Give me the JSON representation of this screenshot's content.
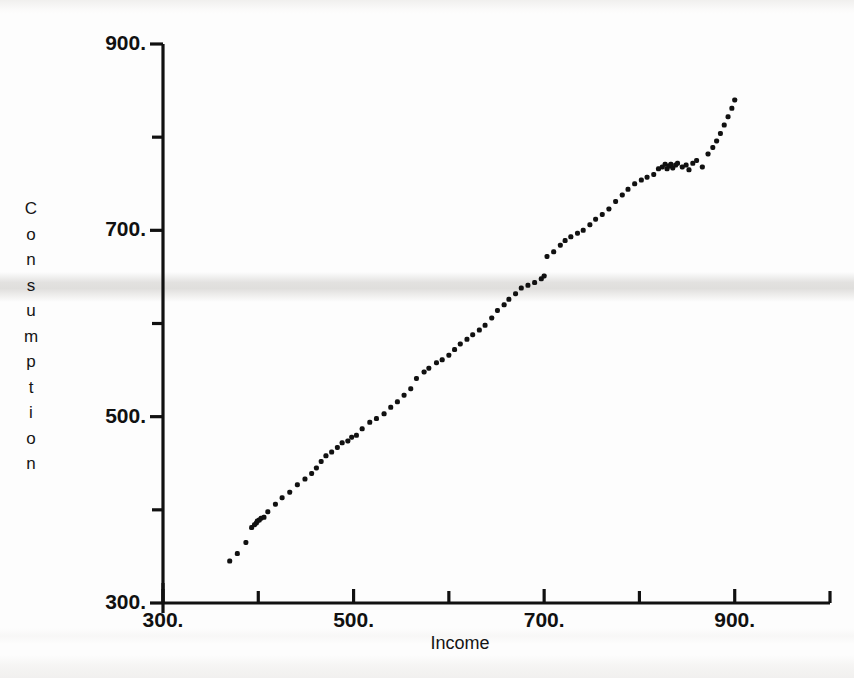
{
  "figure": {
    "background_color": "#fdfdfd",
    "ink_color": "#111111",
    "artifact": "horizontal-scan-band"
  },
  "axis_titles": {
    "x": "Income",
    "y": "Consumption",
    "y_stacked_letters": [
      "C",
      "o",
      "n",
      "s",
      "u",
      "m",
      "p",
      "t",
      "i",
      "o",
      "n"
    ]
  },
  "x_tick_labels": [
    "300.",
    "500.",
    "700.",
    "900."
  ],
  "y_tick_labels": [
    "300.",
    "500.",
    "700.",
    "900."
  ],
  "chart_data": {
    "type": "scatter",
    "title": "",
    "xlabel": "Income",
    "ylabel": "Consumption",
    "xlim": [
      300,
      1000
    ],
    "ylim": [
      300,
      900
    ],
    "xticks": [
      300,
      500,
      700,
      900
    ],
    "yticks": [
      300,
      500,
      700,
      900
    ],
    "xticks_minor": [
      400,
      600,
      800,
      1000
    ],
    "yticks_minor": [
      400,
      600,
      800
    ],
    "xtick_format": "trailing-period",
    "ytick_format": "trailing-period",
    "grid": false,
    "legend": null,
    "marker": "dot",
    "marker_size_px": 5,
    "marker_color": "#111111",
    "points": [
      [
        370,
        345
      ],
      [
        378,
        353
      ],
      [
        387,
        365
      ],
      [
        393,
        381
      ],
      [
        396,
        384
      ],
      [
        398,
        386
      ],
      [
        399,
        388
      ],
      [
        401,
        389
      ],
      [
        403,
        391
      ],
      [
        406,
        392
      ],
      [
        410,
        398
      ],
      [
        418,
        406
      ],
      [
        425,
        413
      ],
      [
        433,
        419
      ],
      [
        441,
        427
      ],
      [
        449,
        433
      ],
      [
        456,
        439
      ],
      [
        461,
        445
      ],
      [
        466,
        452
      ],
      [
        471,
        458
      ],
      [
        477,
        462
      ],
      [
        483,
        467
      ],
      [
        488,
        472
      ],
      [
        494,
        474
      ],
      [
        498,
        478
      ],
      [
        503,
        480
      ],
      [
        509,
        487
      ],
      [
        517,
        494
      ],
      [
        524,
        498
      ],
      [
        532,
        503
      ],
      [
        539,
        510
      ],
      [
        546,
        516
      ],
      [
        553,
        523
      ],
      [
        560,
        530
      ],
      [
        566,
        541
      ],
      [
        574,
        548
      ],
      [
        579,
        552
      ],
      [
        587,
        558
      ],
      [
        593,
        561
      ],
      [
        600,
        566
      ],
      [
        606,
        572
      ],
      [
        612,
        578
      ],
      [
        619,
        583
      ],
      [
        625,
        588
      ],
      [
        632,
        593
      ],
      [
        638,
        598
      ],
      [
        645,
        606
      ],
      [
        651,
        614
      ],
      [
        658,
        620
      ],
      [
        663,
        626
      ],
      [
        670,
        632
      ],
      [
        676,
        638
      ],
      [
        683,
        641
      ],
      [
        690,
        644
      ],
      [
        697,
        648
      ],
      [
        700,
        651
      ],
      [
        703,
        672
      ],
      [
        710,
        677
      ],
      [
        717,
        684
      ],
      [
        722,
        689
      ],
      [
        728,
        693
      ],
      [
        735,
        697
      ],
      [
        741,
        700
      ],
      [
        748,
        706
      ],
      [
        754,
        712
      ],
      [
        761,
        717
      ],
      [
        768,
        723
      ],
      [
        775,
        731
      ],
      [
        782,
        738
      ],
      [
        788,
        744
      ],
      [
        795,
        750
      ],
      [
        802,
        754
      ],
      [
        808,
        757
      ],
      [
        815,
        760
      ],
      [
        820,
        766
      ],
      [
        824,
        768
      ],
      [
        827,
        771
      ],
      [
        829,
        766
      ],
      [
        831,
        769
      ],
      [
        833,
        771
      ],
      [
        835,
        767
      ],
      [
        838,
        770
      ],
      [
        840,
        772
      ],
      [
        845,
        768
      ],
      [
        849,
        770
      ],
      [
        852,
        765
      ],
      [
        856,
        772
      ],
      [
        860,
        775
      ],
      [
        866,
        768
      ],
      [
        872,
        782
      ],
      [
        877,
        789
      ],
      [
        881,
        796
      ],
      [
        885,
        804
      ],
      [
        889,
        813
      ],
      [
        893,
        822
      ],
      [
        897,
        831
      ],
      [
        900,
        840
      ]
    ]
  }
}
